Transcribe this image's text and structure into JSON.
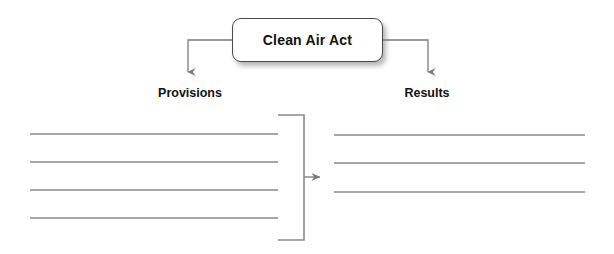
{
  "diagram": {
    "type": "cause-and-effect graphic organizer",
    "central_node": {
      "label": "Clean Air Act",
      "shape": "rounded-rectangle",
      "border_color": "#4a4a4a",
      "fill_color": "#ffffff"
    },
    "branches": [
      {
        "label": "Provisions",
        "side": "left"
      },
      {
        "label": "Results",
        "side": "right"
      }
    ],
    "left_column": {
      "heading": "Provisions",
      "blank_lines": 4,
      "line_values": [
        "",
        "",
        "",
        ""
      ]
    },
    "right_column": {
      "heading": "Results",
      "blank_lines": 3,
      "line_values": [
        "",
        "",
        ""
      ]
    },
    "connectors": {
      "left_arrow_label": "",
      "right_arrow_label": "",
      "center_arrow_label": "",
      "bracket_description": "grouping bracket around left column"
    },
    "colors": {
      "line": "#8a8a8a",
      "arrow": "#7a7a7a",
      "text": "#111111",
      "background": "#ffffff"
    }
  }
}
